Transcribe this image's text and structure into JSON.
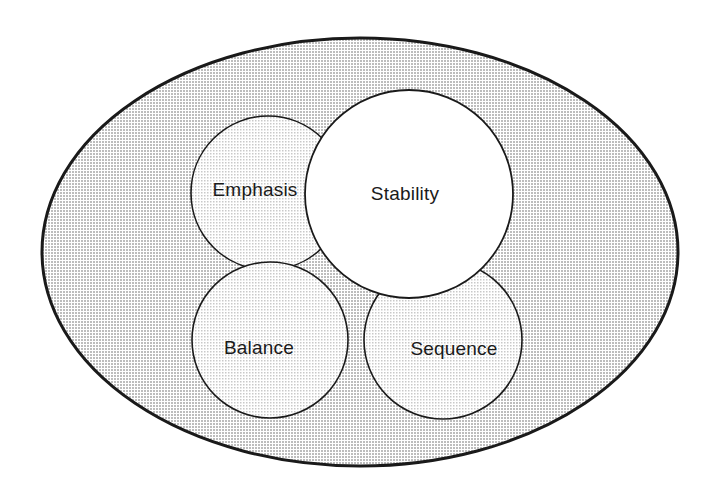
{
  "diagram": {
    "type": "venn",
    "background_color": "#ffffff",
    "container": {
      "name": "outer-ellipse",
      "label": "",
      "fill_color": "#d9d9d9",
      "stroke_color": "#1a1a1a",
      "stroke_width": 3,
      "center_x": 360,
      "center_y": 252,
      "radius_x": 318,
      "radius_y": 214
    },
    "sets": [
      {
        "id": "emphasis",
        "label": "Emphasis",
        "fill_color": "#e9e9e9",
        "stroke_color": "#1a1a1a",
        "stroke_width": 1.6,
        "center_x": 268,
        "center_y": 193,
        "radius": 77,
        "label_x": 255,
        "label_y": 191,
        "layer": 1
      },
      {
        "id": "balance",
        "label": "Balance",
        "fill_color": "#e9e9e9",
        "stroke_color": "#1a1a1a",
        "stroke_width": 1.6,
        "center_x": 270,
        "center_y": 340,
        "radius": 78,
        "label_x": 259,
        "label_y": 349,
        "layer": 2
      },
      {
        "id": "sequence",
        "label": "Sequence",
        "fill_color": "#e9e9e9",
        "stroke_color": "#1a1a1a",
        "stroke_width": 1.6,
        "center_x": 443,
        "center_y": 340,
        "radius": 79,
        "label_x": 454,
        "label_y": 350,
        "layer": 3
      },
      {
        "id": "stability",
        "label": "Stability",
        "fill_color": "#ffffff",
        "stroke_color": "#1a1a1a",
        "stroke_width": 1.8,
        "center_x": 409,
        "center_y": 194,
        "radius": 104,
        "label_x": 405,
        "label_y": 195,
        "layer": 4
      }
    ]
  }
}
